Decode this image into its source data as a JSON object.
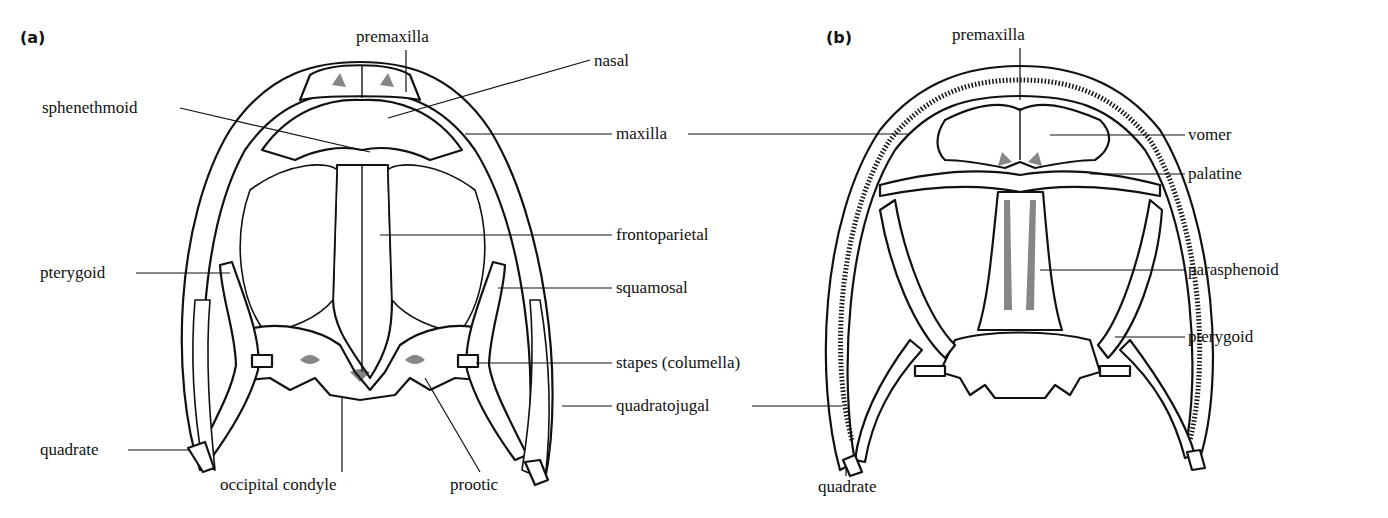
{
  "figure": {
    "panels": [
      {
        "tag": "(a)",
        "labels": {
          "premaxilla": "premaxilla",
          "nasal": "nasal",
          "sphenethmoid": "sphenethmoid",
          "maxilla": "maxilla",
          "frontoparietal": "frontoparietal",
          "pterygoid": "pterygoid",
          "squamosal": "squamosal",
          "stapes": "stapes (columella)",
          "quadratojugal": "quadratojugal",
          "quadrate": "quadrate",
          "occipital_condyle": "occipital condyle",
          "prootic": "prootic"
        }
      },
      {
        "tag": "(b)",
        "labels": {
          "premaxilla": "premaxilla",
          "vomer": "vomer",
          "palatine": "palatine",
          "parasphenoid": "parasphenoid",
          "pterygoid": "pterygoid",
          "quadrate": "quadrate"
        }
      }
    ]
  }
}
